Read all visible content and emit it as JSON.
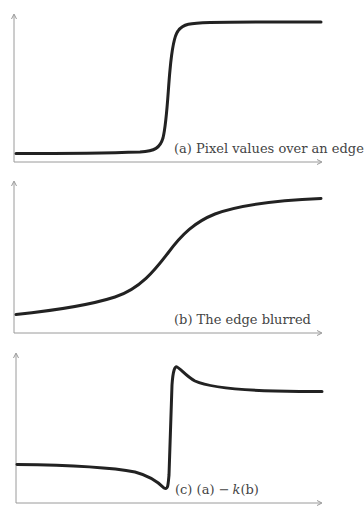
{
  "figure": {
    "panels": [
      {
        "id": "a",
        "caption_prefix": "(a)",
        "caption_text": "Pixel values over an edge",
        "description": "sharp step edge"
      },
      {
        "id": "b",
        "caption_prefix": "(b)",
        "caption_text": "The edge blurred",
        "description": "smooth sigmoid"
      },
      {
        "id": "c",
        "caption_prefix": "(c)",
        "caption_a": "(a)",
        "caption_minus": "−",
        "caption_k": "k",
        "caption_b": "(b)",
        "description": "unsharp mask result with undershoot and overshoot"
      }
    ],
    "colors": {
      "curve": "#222222",
      "axis": "#9a9a9a",
      "caption": "#444444"
    }
  }
}
